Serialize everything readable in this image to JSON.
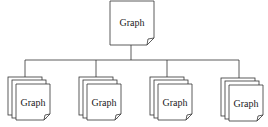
{
  "diagram": {
    "root": {
      "label": "Graph"
    },
    "children": [
      {
        "label": "Graph"
      },
      {
        "label": "Graph"
      },
      {
        "label": "Graph"
      },
      {
        "label": "Graph"
      }
    ],
    "colors": {
      "stroke": "#333333",
      "fill": "#ffffff"
    }
  }
}
